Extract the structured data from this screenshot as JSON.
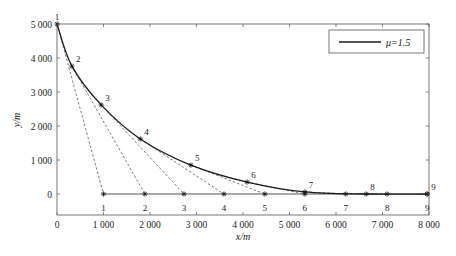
{
  "chart_data": {
    "type": "line",
    "title": "",
    "xlabel": "x/m",
    "ylabel": "y/m",
    "xlim": [
      0,
      8000
    ],
    "ylim": [
      -600,
      5000
    ],
    "grid": false,
    "legend_position": "upper right",
    "x_ticks": [
      0,
      1000,
      2000,
      3000,
      4000,
      5000,
      6000,
      7000,
      8000
    ],
    "x_tick_labels": [
      "0",
      "1 000",
      "2 000",
      "3 000",
      "4 000",
      "5 000",
      "6 000",
      "7 000",
      "8 000"
    ],
    "y_ticks": [
      0,
      1000,
      2000,
      3000,
      4000,
      5000
    ],
    "y_tick_labels": [
      "0",
      "1 000",
      "2 000",
      "3 000",
      "4 000",
      "5 000"
    ],
    "series": [
      {
        "name": "μ=1.5",
        "style": "solid",
        "marker": "*",
        "x": [
          0,
          320,
          950,
          1790,
          2880,
          4090,
          5330,
          6650,
          7960
        ],
        "y": [
          5000,
          3760,
          2620,
          1620,
          850,
          350,
          60,
          0,
          0
        ],
        "point_labels": [
          "1",
          "2",
          "3",
          "4",
          "5",
          "6",
          "7",
          "8",
          "9"
        ]
      },
      {
        "name": "ground points",
        "style": "solid",
        "marker": "*",
        "x": [
          1000,
          1890,
          2730,
          3590,
          4470,
          5330,
          6210,
          7100,
          7960
        ],
        "y": [
          0,
          0,
          0,
          0,
          0,
          0,
          0,
          0,
          0
        ],
        "point_labels": [
          "1",
          "2",
          "3",
          "4",
          "5",
          "6",
          "7",
          "8",
          "9"
        ]
      }
    ],
    "connectors": {
      "style": "dashed",
      "description": "dashed lines from curve point i to ground point i",
      "pairs": [
        [
          1,
          1
        ],
        [
          2,
          2
        ],
        [
          3,
          3
        ],
        [
          4,
          4
        ],
        [
          5,
          5
        ],
        [
          6,
          6
        ],
        [
          7,
          7
        ],
        [
          8,
          8
        ]
      ]
    }
  },
  "legend": {
    "label": "μ=1.5"
  },
  "colors": {
    "curve": "#1a1a1a",
    "axis": "#333333",
    "dashed": "#444444",
    "ground": "#555555"
  }
}
